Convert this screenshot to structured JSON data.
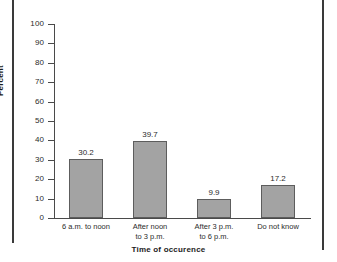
{
  "figure": {
    "background_color": "#ffffff",
    "frame_color": "#3a3a3a"
  },
  "chart_data": {
    "type": "bar",
    "title": "",
    "subtitle": "",
    "xlabel": "Time of occurence",
    "ylabel": "Percent",
    "categories": [
      "6 a.m. to noon",
      "After noon\nto 3 p.m.",
      "After 3 p.m.\nto 6 p.m.",
      "Do not know"
    ],
    "values": [
      30.2,
      39.7,
      9.9,
      17.2
    ],
    "value_labels": [
      "30.2",
      "39.7",
      "9.9",
      "17.2"
    ],
    "ylim": [
      0,
      100
    ],
    "ytick_step": 10,
    "ytick_labels": [
      "100",
      "90",
      "80",
      "70",
      "60",
      "50",
      "40",
      "30",
      "20",
      "10",
      "0"
    ],
    "ytick_values": [
      100,
      90,
      80,
      70,
      60,
      50,
      40,
      30,
      20,
      10,
      0
    ],
    "grid": false,
    "legend": false,
    "legend_position": "none",
    "bar_fill_color": "#a3a3a3",
    "bar_border_color": "#5d5d5d",
    "axis_color": "#4a4a4a",
    "text_color": "#2b2b2b"
  }
}
